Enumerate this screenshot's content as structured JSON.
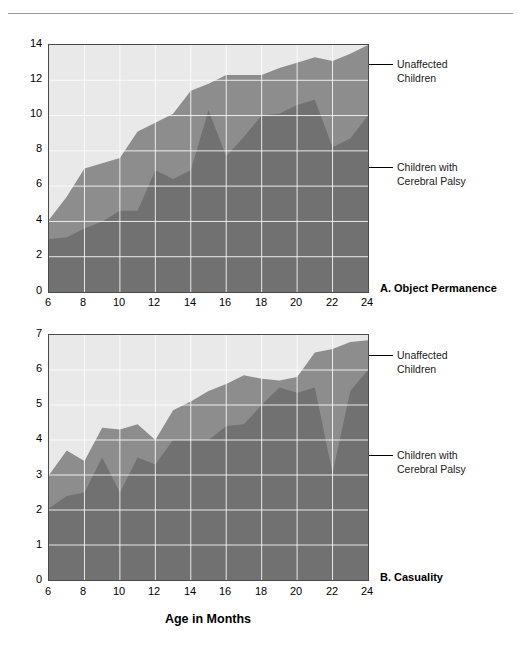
{
  "figure": {
    "x_axis_title": "Age in Months",
    "legend": {
      "upper_label_line1": "Unaffected",
      "upper_label_line2": "Children",
      "lower_label_line1": "Children with",
      "lower_label_line2": "Cerebral Palsy"
    },
    "colors": {
      "plot_background": "#e9e9e9",
      "unaffected_band": "#8d8d8d",
      "cerebral_palsy_band": "#717171",
      "gridline": "#ffffff",
      "axis_frame": "#4a4a4a",
      "rule": "#9a9a9a",
      "text": "#000000"
    }
  },
  "chart_data": [
    {
      "type": "area",
      "id": "A",
      "title": "A. Object Permanence",
      "stacked": false,
      "overlaid": true,
      "xlabel": "Age in Months",
      "ylabel": "",
      "xlim": [
        6,
        24
      ],
      "ylim": [
        0,
        14
      ],
      "grid": true,
      "legend_position": "right-callout",
      "xticks": [
        6,
        8,
        10,
        12,
        14,
        16,
        18,
        20,
        22,
        24
      ],
      "yticks": [
        0,
        2,
        4,
        6,
        8,
        10,
        12,
        14
      ],
      "x": [
        6,
        7,
        8,
        9,
        10,
        11,
        12,
        13,
        14,
        15,
        16,
        17,
        18,
        19,
        20,
        21,
        22,
        23,
        24
      ],
      "series": [
        {
          "name": "Unaffected Children",
          "color": "#8d8d8d",
          "values": [
            4.1,
            5.4,
            7.0,
            7.3,
            7.6,
            9.1,
            9.6,
            10.1,
            11.4,
            11.8,
            12.3,
            12.3,
            12.3,
            12.7,
            13.0,
            13.3,
            13.1,
            13.5,
            14.0
          ]
        },
        {
          "name": "Children with Cerebral Palsy",
          "color": "#717171",
          "values": [
            3.0,
            3.1,
            3.6,
            4.0,
            4.6,
            4.6,
            6.9,
            6.4,
            6.9,
            10.3,
            7.7,
            8.8,
            10.0,
            10.1,
            10.6,
            10.9,
            8.2,
            8.7,
            10.0
          ]
        }
      ]
    },
    {
      "type": "area",
      "id": "B",
      "title": "B. Casuality",
      "stacked": false,
      "overlaid": true,
      "xlabel": "Age in Months",
      "ylabel": "",
      "xlim": [
        6,
        24
      ],
      "ylim": [
        0,
        7
      ],
      "grid": true,
      "legend_position": "right-callout",
      "xticks": [
        6,
        8,
        10,
        12,
        14,
        16,
        18,
        20,
        22,
        24
      ],
      "yticks": [
        0,
        1,
        2,
        3,
        4,
        5,
        6,
        7
      ],
      "x": [
        6,
        7,
        8,
        9,
        10,
        11,
        12,
        13,
        14,
        15,
        16,
        17,
        18,
        19,
        20,
        21,
        22,
        23,
        24
      ],
      "series": [
        {
          "name": "Unaffected Children",
          "color": "#8d8d8d",
          "values": [
            3.0,
            3.7,
            3.4,
            4.35,
            4.3,
            4.45,
            4.0,
            4.85,
            5.1,
            5.4,
            5.6,
            5.85,
            5.75,
            5.7,
            5.8,
            6.5,
            6.6,
            6.8,
            6.85
          ]
        },
        {
          "name": "Children with Cerebral Palsy",
          "color": "#717171",
          "values": [
            2.05,
            2.4,
            2.5,
            3.5,
            2.5,
            3.5,
            3.3,
            4.0,
            4.0,
            4.0,
            4.4,
            4.45,
            5.0,
            5.5,
            5.35,
            5.5,
            3.05,
            5.4,
            6.0
          ]
        }
      ]
    }
  ],
  "charts": [
    {
      "panel_title": "A. Object Permanence",
      "ytick_labels": [
        "14",
        "12",
        "10",
        "8",
        "6",
        "4",
        "2",
        "0"
      ],
      "xtick_labels": [
        "6",
        "8",
        "10",
        "12",
        "14",
        "16",
        "18",
        "20",
        "22",
        "24"
      ]
    },
    {
      "panel_title": "B. Casuality",
      "ytick_labels": [
        "7",
        "6",
        "5",
        "4",
        "3",
        "2",
        "1",
        "0"
      ],
      "xtick_labels": [
        "6",
        "8",
        "10",
        "12",
        "14",
        "16",
        "18",
        "20",
        "22",
        "24"
      ]
    }
  ]
}
